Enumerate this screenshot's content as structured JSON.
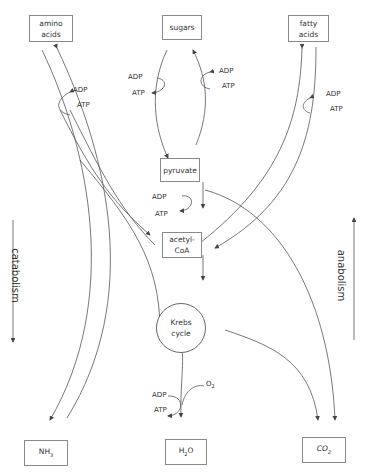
{
  "nodes": {
    "amino_acids": {
      "line1": "amino",
      "line2": "acids"
    },
    "sugars": {
      "label": "sugars"
    },
    "fatty_acids": {
      "line1": "fatty",
      "line2": "acids"
    },
    "pyruvate": {
      "label": "pyruvate"
    },
    "acetyl_coa": {
      "line1": "acetyl-",
      "line2": "CoA"
    },
    "krebs": {
      "line1": "Krebs",
      "line2": "cycle"
    },
    "nh3": {
      "base": "NH",
      "sub": "3"
    },
    "h2o": {
      "base1": "H",
      "sub": "2",
      "base2": "O"
    },
    "co2": {
      "base": "CO",
      "sub": "2"
    }
  },
  "energy_labels": {
    "amino": {
      "adp": "ADP",
      "atp": "ATP"
    },
    "sugars": {
      "adp": "ADP",
      "atp": "ATP"
    },
    "sugars_right": {
      "adp": "ADP",
      "atp": "ATP"
    },
    "fatty": {
      "adp": "ADP",
      "atp": "ATP"
    },
    "pyruvate": {
      "adp": "ADP",
      "atp": "ATP"
    },
    "krebs": {
      "adp": "ADP",
      "atp": "ATP"
    },
    "oxygen": {
      "base": "O",
      "sub": "2"
    }
  },
  "side_labels": {
    "left": "catabolism",
    "right": "anabolism"
  }
}
